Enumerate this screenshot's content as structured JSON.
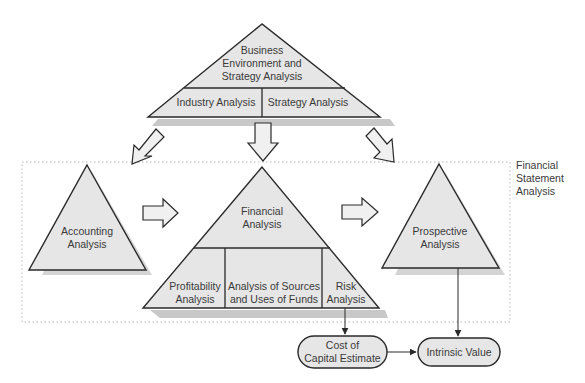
{
  "diagram": {
    "colors": {
      "fill": "#e6e6e6",
      "stroke": "#2a2a2a",
      "shadow": "#c8c8c8",
      "dotted_border": "#b5b5b5",
      "background": "#ffffff"
    },
    "top_pyramid": {
      "title_lines": [
        "Business",
        "Environment and",
        "Strategy Analysis"
      ],
      "sections": [
        "Industry Analysis",
        "Strategy Analysis"
      ]
    },
    "group": {
      "label_lines": [
        "Financial",
        "Statement",
        "Analysis"
      ]
    },
    "accounting": {
      "label_lines": [
        "Accounting",
        "Analysis"
      ]
    },
    "financial": {
      "title_lines": [
        "Financial",
        "Analysis"
      ],
      "sections": [
        {
          "lines": [
            "Profitability",
            "Analysis"
          ]
        },
        {
          "lines": [
            "Analysis of Sources",
            "and Uses of Funds"
          ]
        },
        {
          "lines": [
            "Risk",
            "Analysis"
          ]
        }
      ]
    },
    "prospective": {
      "label_lines": [
        "Prospective",
        "Analysis"
      ]
    },
    "outputs": {
      "cost_of_capital_lines": [
        "Cost of",
        "Capital Estimate"
      ],
      "intrinsic_value": "Intrinsic Value"
    }
  }
}
